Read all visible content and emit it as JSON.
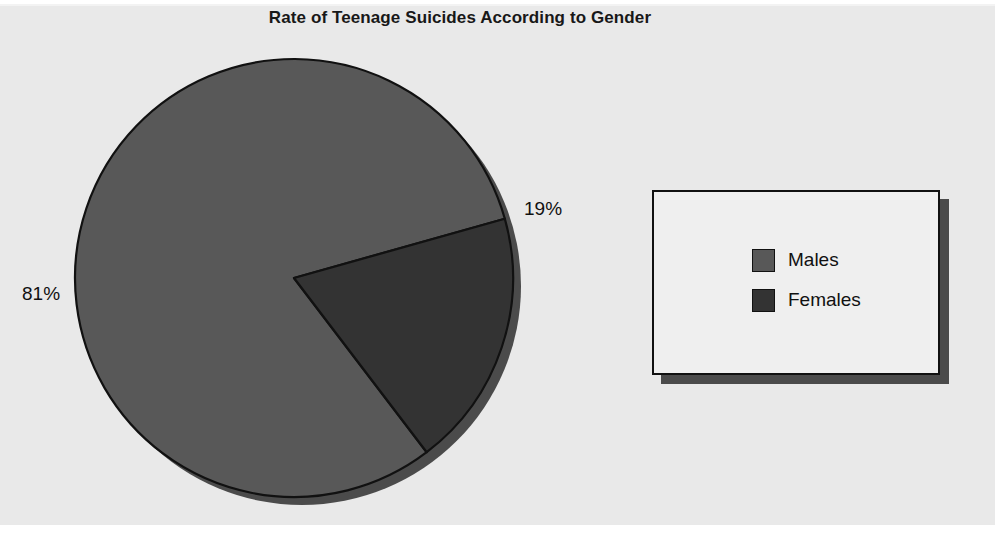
{
  "chart_data": {
    "type": "pie",
    "title": "Rate of Teenage Suicides According to Gender",
    "categories": [
      "Males",
      "Females"
    ],
    "values": [
      81,
      19
    ],
    "value_unit": "%",
    "data_labels": [
      "81%",
      "19%"
    ],
    "colors": [
      "#585858",
      "#333333"
    ],
    "legend": {
      "position": "right",
      "entries": [
        {
          "label": "Males",
          "color": "#585858"
        },
        {
          "label": "Females",
          "color": "#333333"
        }
      ]
    },
    "start_angle_deg": 15.7,
    "direction": "counterclockwise",
    "xlabel": "",
    "ylabel": "",
    "grid": false
  },
  "title": "Rate of Teenage Suicides According to Gender",
  "labels": {
    "males_pct": "81%",
    "females_pct": "19%"
  },
  "legend": {
    "items": [
      {
        "label": "Males"
      },
      {
        "label": "Females"
      }
    ]
  },
  "colors": {
    "panel_background": "#e9e9e9",
    "males_slice": "#585858",
    "females_slice": "#333333",
    "outline": "#111111",
    "legend_fill": "#efefef",
    "legend_shadow": "#4b4b4b"
  }
}
